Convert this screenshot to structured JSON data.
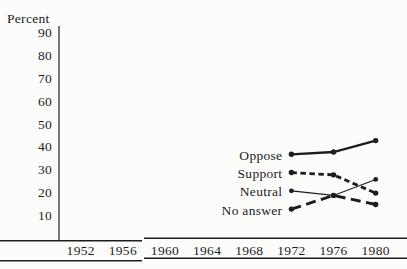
{
  "figure": {
    "ink_color": "#1d1d1d",
    "background_color": "#fcfcfb",
    "y_axis_title": "Percent"
  },
  "chart_data": {
    "type": "line",
    "title": "",
    "xlabel": "",
    "ylabel": "Percent",
    "grid": false,
    "legend_position": "inline-labels-left-of-first-point",
    "x_tick_labels": [
      "1952",
      "1956",
      "1960",
      "1964",
      "1968",
      "1972",
      "1976",
      "1980"
    ],
    "y_tick_labels": [
      "90",
      "80",
      "70",
      "60",
      "50",
      "40",
      "30",
      "20",
      "10"
    ],
    "ylim": [
      0,
      95
    ],
    "xlim": [
      1944,
      1983
    ],
    "x": [
      1972,
      1976,
      1980
    ],
    "series": [
      {
        "name": "Oppose",
        "values": [
          37,
          38,
          43
        ],
        "line_style": "solid-thick"
      },
      {
        "name": "Support",
        "values": [
          29,
          28,
          20
        ],
        "line_style": "dashed-short"
      },
      {
        "name": "Neutral",
        "values": [
          21,
          19,
          26
        ],
        "line_style": "solid-thin"
      },
      {
        "name": "No answer",
        "values": [
          13,
          19,
          15
        ],
        "line_style": "dashed-long"
      }
    ]
  }
}
